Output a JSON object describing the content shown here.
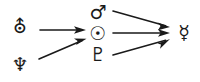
{
  "diagram": {
    "type": "flow-diagram",
    "background_color": "#ffffff",
    "ink_color": "#1a1a1a",
    "width": 200,
    "height": 82,
    "nodes": [
      {
        "id": "uranus",
        "icon_name": "uranus-symbol",
        "glyph": "⛢",
        "label": "Uranus",
        "column": "left",
        "x": 20,
        "y": 27,
        "font_size": 19
      },
      {
        "id": "neptune",
        "icon_name": "neptune-symbol",
        "glyph": "♆",
        "label": "Neptune",
        "column": "left",
        "x": 20,
        "y": 65,
        "font_size": 19
      },
      {
        "id": "mars",
        "icon_name": "mars-symbol",
        "glyph": "♂",
        "label": "Mars",
        "column": "middle",
        "x": 98,
        "y": 13,
        "font_size": 19
      },
      {
        "id": "sun",
        "icon_name": "sun-symbol",
        "glyph": "☉",
        "label": "Sun",
        "column": "middle",
        "x": 98,
        "y": 34,
        "font_size": 19
      },
      {
        "id": "pluto",
        "icon_name": "pluto-symbol",
        "glyph": "♇",
        "label": "Pluto",
        "column": "middle",
        "x": 98,
        "y": 55,
        "font_size": 19
      },
      {
        "id": "mercury",
        "icon_name": "mercury-symbol",
        "glyph": "☿",
        "label": "Mercury",
        "column": "right",
        "x": 184,
        "y": 33,
        "font_size": 19
      }
    ],
    "edges": [
      {
        "id": "uranus-to-sun",
        "from": "uranus",
        "to": "sun",
        "x1": 40,
        "y1": 30,
        "x2": 86,
        "y2": 30,
        "stroke_width": 1.6
      },
      {
        "id": "neptune-to-sun",
        "from": "neptune",
        "to": "sun",
        "x1": 39,
        "y1": 59,
        "x2": 86,
        "y2": 39,
        "stroke_width": 1.6
      },
      {
        "id": "mars-to-mercury",
        "from": "mars",
        "to": "mercury",
        "x1": 113,
        "y1": 11,
        "x2": 170,
        "y2": 27,
        "stroke_width": 1.6
      },
      {
        "id": "sun-to-mercury",
        "from": "sun",
        "to": "mercury",
        "x1": 113,
        "y1": 33,
        "x2": 170,
        "y2": 33,
        "stroke_width": 1.6
      },
      {
        "id": "pluto-to-mercury",
        "from": "pluto",
        "to": "mercury",
        "x1": 113,
        "y1": 55,
        "x2": 170,
        "y2": 39,
        "stroke_width": 1.6
      }
    ]
  }
}
